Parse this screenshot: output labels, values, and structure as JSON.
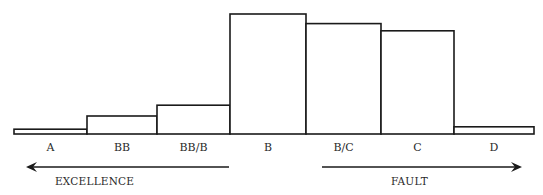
{
  "chart_data": {
    "type": "bar",
    "title": "",
    "xlabel": "",
    "ylabel": "",
    "categories": [
      "A",
      "BB",
      "BB/B",
      "B",
      "B/C",
      "C",
      "D"
    ],
    "values": [
      4,
      15,
      24,
      100,
      92,
      86,
      6
    ],
    "value_scale": "relative (no y-axis shown); tallest bar = 100",
    "ylim": [
      0,
      100
    ],
    "grid": false,
    "legend": null,
    "annotations": [
      {
        "text": "EXCELLENCE",
        "arrow": "left",
        "span": [
          "A",
          "BB/B"
        ]
      },
      {
        "text": "FAULT",
        "arrow": "right",
        "span": [
          "B/C",
          "D"
        ]
      }
    ]
  },
  "labels": {
    "excellence": "EXCELLENCE",
    "fault": "FAULT"
  }
}
